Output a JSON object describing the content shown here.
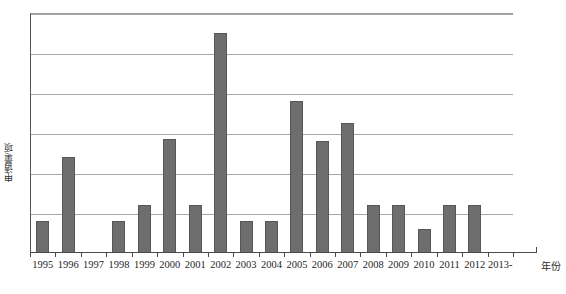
{
  "chart_data": {
    "type": "bar",
    "title": "",
    "xlabel": "年份",
    "ylabel": "申请量/项",
    "categories": [
      "1995",
      "1996",
      "1997",
      "1998",
      "1999",
      "2000",
      "2001",
      "2002",
      "2003",
      "2004",
      "2005",
      "2006",
      "2007",
      "2008",
      "2009",
      "2010",
      "2011",
      "2012",
      "2013-"
    ],
    "values": [
      0.8,
      2.4,
      0,
      0.8,
      1.2,
      2.85,
      1.2,
      5.5,
      0.8,
      0.8,
      3.8,
      2.8,
      3.25,
      1.2,
      1.2,
      0.6,
      1.2,
      1.2,
      0
    ],
    "ylim": [
      0,
      6
    ],
    "yticks": [
      0,
      1,
      2,
      3,
      4,
      5,
      6
    ],
    "grid": true,
    "legend": null,
    "bar_color": "#6e6e6e",
    "grid_color": "#a8a8a8",
    "axis_color": "#4a4a4a"
  },
  "axes": {
    "y_title": "申请量/项",
    "x_title": "年份"
  }
}
